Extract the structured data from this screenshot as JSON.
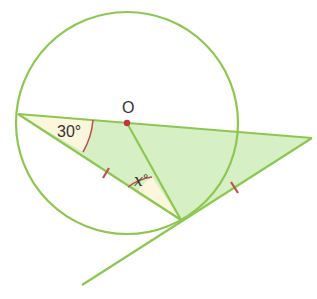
{
  "diagram": {
    "type": "circle-geometry",
    "labels": {
      "center": "O",
      "angle_known": "30°",
      "angle_unknown_var": "x",
      "angle_unknown_deg": "°"
    },
    "colors": {
      "line": "#8cc850",
      "fill_green": "#d6efc4",
      "fill_cream": "#fbf6dc",
      "mark_red": "#c0504d",
      "center_dot": "#c8323c",
      "text": "#333333"
    },
    "elements": [
      "circle with center O",
      "chord from left point A through O (diameter direction) to external point C",
      "chord from A to tangent point B",
      "radius OB",
      "tangent line at B extending to C",
      "equal tick marks on AB and BC",
      "angle 30° at A",
      "angle x° at B between BA and BO"
    ]
  }
}
